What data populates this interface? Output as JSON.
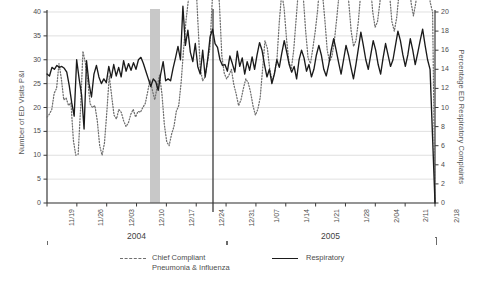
{
  "chart_data": {
    "type": "line",
    "title": "",
    "xlabel": "",
    "ylabel": "Number of ED Visits P&I",
    "y2label": "Percentage ED Respiratory Complaints",
    "ylim": [
      0,
      40
    ],
    "y2lim": [
      0,
      20
    ],
    "yticks": [
      0,
      5,
      10,
      15,
      20,
      25,
      30,
      35,
      40
    ],
    "y2ticks": [
      0,
      2,
      4,
      6,
      8,
      10,
      12,
      14,
      16,
      18,
      20
    ],
    "grid": true,
    "legend_position": "below-plot",
    "x_tick_labels": [
      "11/19",
      "11/26",
      "12/03",
      "12/10",
      "12/17",
      "12/24",
      "12/31",
      "1/07",
      "1/14",
      "1/21",
      "1/28",
      "2/04",
      "2/11",
      "2/18"
    ],
    "x_groups": [
      {
        "label": "2004",
        "from": "11/19",
        "to": "12/31"
      },
      {
        "label": "2005",
        "from": "12/31",
        "to": "2/18"
      }
    ],
    "annotations": [
      {
        "name": "grey-band",
        "type": "vspan",
        "from_x": "12/11",
        "to_x": "12/13",
        "color": "#c8c8c8"
      },
      {
        "name": "event-vertical-line",
        "type": "vline",
        "at_x": "12/30",
        "color": "#2b2b2b"
      }
    ],
    "series": [
      {
        "name": "Chief Compliant Pneumonia & Influenza",
        "legend_label": "Chief Compliant\nPneumonia & Influenza",
        "style": "dotted",
        "color": "#6f6f6f",
        "axis": "right",
        "values": [
          9.0,
          9.3,
          9.8,
          11.5,
          12.0,
          14.6,
          13.0,
          10.8,
          11.0,
          10.2,
          10.5,
          6.6,
          5.0,
          5.1,
          9.8,
          15.9,
          14.7,
          12.8,
          10.4,
          10.0,
          10.2,
          8.6,
          6.0,
          5.0,
          6.3,
          9.6,
          13.3,
          11.2,
          9.2,
          8.8,
          9.8,
          9.5,
          8.6,
          8.0,
          8.4,
          9.3,
          9.8,
          9.0,
          9.6,
          9.5,
          10.0,
          10.4,
          11.6,
          12.9,
          11.8,
          10.8,
          12.2,
          13.4,
          11.4,
          8.2,
          6.4,
          6.0,
          7.2,
          8.0,
          9.6,
          10.2,
          12.6,
          16.0,
          19.0,
          21.2,
          24.4,
          25.8,
          24.0,
          19.0,
          14.0,
          12.8,
          13.2,
          14.8,
          16.2,
          21.2,
          25.6,
          24.2,
          20.8,
          15.4,
          13.6,
          13.0,
          13.4,
          14.0,
          12.4,
          11.4,
          10.2,
          10.8,
          12.0,
          13.0,
          12.6,
          11.6,
          10.2,
          9.2,
          9.8,
          11.0,
          14.0,
          17.0,
          16.2,
          14.0,
          12.8,
          13.6,
          15.0,
          19.0,
          22.0,
          20.4,
          17.2,
          14.8,
          14.0,
          16.0,
          19.2,
          22.4,
          23.8,
          21.6,
          18.0,
          15.2,
          14.6,
          16.2,
          18.0,
          20.2,
          23.4,
          22.0,
          19.2,
          16.0,
          14.8,
          15.4,
          17.0,
          19.4,
          22.0,
          24.0,
          26.0,
          24.4,
          21.0,
          18.0,
          16.4,
          17.0,
          19.0,
          22.0,
          26.0,
          28.0,
          26.4,
          23.0,
          20.0,
          18.4,
          19.0,
          21.0,
          24.0,
          27.0,
          25.4,
          22.0,
          19.0,
          18.0,
          19.4,
          22.0,
          26.0,
          28.6,
          27.0,
          24.0,
          21.0,
          19.6,
          21.0,
          24.0,
          27.4,
          29.4,
          27.6,
          24.0,
          21.0,
          20.0,
          0.0
        ]
      },
      {
        "name": "Respiratory",
        "legend_label": "Respiratory",
        "style": "solid",
        "color": "#1b1b1b",
        "axis": "left",
        "values": [
          27.0,
          26.6,
          28.4,
          28.0,
          28.8,
          28.4,
          28.6,
          28.2,
          27.4,
          24.6,
          21.0,
          18.2,
          30.0,
          26.0,
          22.6,
          15.5,
          29.8,
          25.0,
          22.2,
          27.0,
          28.8,
          26.4,
          25.0,
          26.0,
          25.2,
          28.6,
          26.2,
          29.0,
          26.6,
          28.4,
          26.4,
          29.8,
          27.6,
          29.2,
          27.8,
          29.4,
          28.0,
          30.0,
          30.5,
          29.2,
          27.6,
          26.0,
          24.4,
          26.0,
          25.4,
          23.6,
          27.0,
          29.6,
          25.6,
          26.0,
          25.6,
          28.2,
          30.4,
          32.8,
          30.0,
          41.2,
          33.0,
          36.2,
          31.6,
          29.6,
          33.4,
          28.6,
          27.0,
          32.0,
          26.4,
          30.0,
          34.8,
          36.4,
          33.4,
          32.6,
          30.0,
          28.8,
          29.0,
          27.6,
          30.8,
          29.2,
          27.4,
          31.8,
          28.6,
          30.4,
          27.0,
          29.6,
          27.8,
          30.6,
          28.0,
          31.0,
          33.6,
          32.0,
          29.0,
          26.4,
          28.0,
          25.0,
          27.0,
          30.0,
          28.4,
          31.4,
          34.0,
          31.6,
          29.0,
          27.4,
          28.6,
          26.0,
          30.0,
          32.0,
          30.4,
          27.6,
          29.0,
          26.4,
          28.0,
          31.0,
          33.0,
          31.0,
          28.0,
          26.6,
          29.0,
          32.0,
          34.4,
          32.0,
          29.4,
          27.0,
          30.0,
          33.0,
          31.0,
          28.4,
          26.0,
          29.0,
          32.4,
          35.8,
          33.0,
          30.0,
          28.0,
          31.0,
          34.0,
          32.0,
          29.0,
          27.0,
          30.4,
          33.4,
          31.0,
          28.6,
          30.0,
          33.0,
          36.0,
          34.0,
          31.0,
          28.6,
          31.0,
          34.4,
          32.0,
          29.0,
          31.4,
          34.0,
          36.4,
          33.0,
          30.0,
          28.0,
          14.0,
          0.0
        ]
      }
    ]
  },
  "axes": {
    "left_title": "Number of ED Visits P&I",
    "right_title": "Percentage ED Respiratory Complaints"
  },
  "legend": {
    "pni_label": "Chief Compliant\nPneumonia & Influenza",
    "respiratory_label": "Respiratory"
  },
  "colors": {
    "respiratory": "#1b1b1b",
    "pni": "#6f6f6f",
    "band": "#c8c8c8",
    "grid": "#d2d2d2",
    "axis": "#3a3a3a"
  }
}
